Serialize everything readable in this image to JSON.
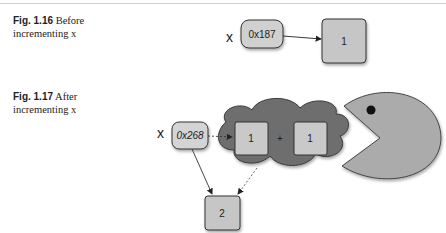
{
  "figures": [
    {
      "number": "Fig. 1.16",
      "caption_line1": "Before",
      "caption_line2": "incrementing x",
      "diagram": {
        "variable": "x",
        "address": "0x187",
        "value": "1"
      }
    },
    {
      "number": "Fig. 1.17",
      "caption_line1": "After",
      "caption_line2": "incrementing x",
      "diagram": {
        "variable": "x",
        "address": "0x268",
        "operand_left": "1",
        "operator": "+",
        "operand_right": "1",
        "result": "2"
      }
    }
  ],
  "colors": {
    "box_fill": "#c8c8c8",
    "cloud_fill": "#6e6e6e",
    "pacman_fill": "#a9a9a9",
    "stroke": "#3a3a3a"
  }
}
